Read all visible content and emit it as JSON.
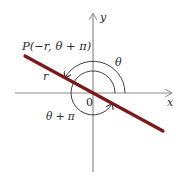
{
  "diagram": {
    "type": "polar-coordinates",
    "labels": {
      "point": "P(−r, θ + π)",
      "r": "r",
      "theta": "θ",
      "theta_plus_pi": "θ + π",
      "origin": "0",
      "x_axis": "x",
      "y_axis": "y"
    },
    "colors": {
      "line": "#7a1a1a",
      "axes": "#8c8c8c",
      "arcs": "#2a2a2a",
      "text": "#2a2a2a"
    },
    "geometry": {
      "origin": [
        93,
        93
      ],
      "line_start": [
        25,
        56
      ],
      "line_end": [
        163,
        131
      ],
      "outer_arc_radius": 32,
      "inner_arc_radius": 22
    }
  }
}
